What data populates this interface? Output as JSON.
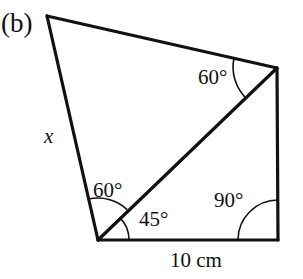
{
  "figure": {
    "part_label": "(b)",
    "shape": "quadrilateral-with-diagonal",
    "stroke_color": "#111111",
    "background_color": "#ffffff",
    "labels": {
      "unknown_side": "x",
      "base_length": "10 cm",
      "angle_top_right": "60°",
      "angle_bottom_left_upper": "60°",
      "angle_bottom_left_lower": "45°",
      "angle_bottom_right": "90°"
    },
    "vertices": {
      "top": {
        "x": 47,
        "y": 16
      },
      "top_right": {
        "x": 277,
        "y": 68
      },
      "bottom_right": {
        "x": 278,
        "y": 240
      },
      "bottom_left": {
        "x": 98,
        "y": 240
      }
    },
    "edges": [
      {
        "name": "top-edge",
        "from": "top",
        "to": "top_right"
      },
      {
        "name": "right-edge",
        "from": "top_right",
        "to": "bottom_right"
      },
      {
        "name": "bottom-edge",
        "from": "bottom_right",
        "to": "bottom_left"
      },
      {
        "name": "left-edge-x",
        "from": "bottom_left",
        "to": "top"
      },
      {
        "name": "diagonal",
        "from": "bottom_left",
        "to": "top_right"
      }
    ],
    "angle_arcs": [
      {
        "name": "arc-top-right-60",
        "vertex": "top_right",
        "radius": 44
      },
      {
        "name": "arc-bottom-left-60",
        "vertex": "bottom_left",
        "radius": 42
      },
      {
        "name": "arc-bottom-left-45",
        "vertex": "bottom_left",
        "radius": 31
      },
      {
        "name": "arc-bottom-right-90",
        "vertex": "bottom_right",
        "radius": 40
      }
    ]
  }
}
